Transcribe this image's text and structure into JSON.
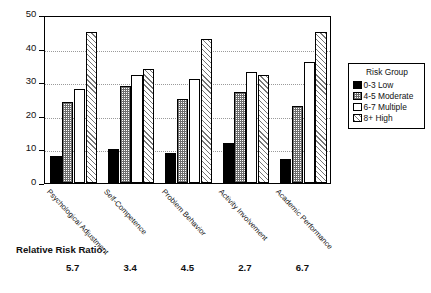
{
  "chart_data": {
    "type": "bar",
    "title": "",
    "subtitle": "",
    "xlabel": "",
    "ylabel": "",
    "ylim": [
      0,
      50
    ],
    "yticks": [
      0,
      10,
      20,
      30,
      40,
      50
    ],
    "ytick_labels": [
      "0",
      "10",
      "20",
      "30",
      "40",
      "50"
    ],
    "grid": true,
    "grid_axis": "y",
    "legend_position": "right",
    "legend_title": "Risk Group",
    "categories": [
      "Psychological Adjustment",
      "Self-Competence",
      "Problem Behavior",
      "Activity Involvement",
      "Academic Performance"
    ],
    "series": [
      {
        "name": "0-3 Low",
        "values": [
          8,
          10,
          9,
          12,
          7
        ],
        "color": "#000000",
        "pattern": "solid-black"
      },
      {
        "name": "4-5 Moderate",
        "values": [
          24,
          29,
          25,
          27,
          23
        ],
        "color": "#808080",
        "pattern": "checker-gray"
      },
      {
        "name": "6-7 Multiple",
        "values": [
          28,
          32,
          31,
          33,
          36
        ],
        "color": "#ffffff",
        "pattern": "open-white"
      },
      {
        "name": "8+  High",
        "values": [
          45,
          34,
          43,
          32,
          45
        ],
        "color": "#ffffff",
        "pattern": "diagonal-hatch"
      }
    ],
    "annotations": {
      "ratio_label": "Relative Risk Ratio:",
      "ratio_values": [
        "5.7",
        "3.4",
        "4.5",
        "2.7",
        "6.7"
      ]
    }
  },
  "legend": {
    "title": "Risk Group",
    "items": [
      {
        "label": "0-3 Low"
      },
      {
        "label": "4-5 Moderate"
      },
      {
        "label": "6-7 Multiple"
      },
      {
        "label": "8+  High"
      }
    ]
  },
  "axis": {
    "y_labels": [
      "50",
      "40",
      "30",
      "20",
      "10",
      "0"
    ]
  },
  "ratio": {
    "title": "Relative Risk Ratio:",
    "values": [
      "5.7",
      "3.4",
      "4.5",
      "2.7",
      "6.7"
    ]
  }
}
